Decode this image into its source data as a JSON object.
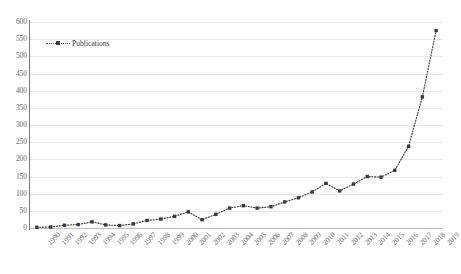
{
  "chart_data": {
    "type": "line",
    "title": "",
    "xlabel": "",
    "ylabel": "",
    "ylim": [
      0,
      600
    ],
    "ytick_step": 50,
    "yticks": [
      600,
      550,
      500,
      450,
      400,
      350,
      300,
      250,
      200,
      150,
      100,
      50,
      0
    ],
    "grid": true,
    "legend_position": "top-left",
    "legend_entries": [
      "Publications"
    ],
    "line_style": "dotted",
    "marker": "square",
    "series_color": "#3a3a3a",
    "categories": [
      "1990",
      "1991",
      "1992",
      "1993",
      "1994",
      "1995",
      "1996",
      "1997",
      "1998",
      "1999",
      "2000",
      "2001",
      "2002",
      "2003",
      "2004",
      "2005",
      "2006",
      "2007",
      "2008",
      "2009",
      "2010",
      "2011",
      "2012",
      "2013",
      "2014",
      "2015",
      "2016",
      "2017",
      "2018",
      "2019"
    ],
    "series": [
      {
        "name": "Publications",
        "values": [
          2,
          3,
          8,
          10,
          18,
          9,
          7,
          12,
          22,
          26,
          34,
          47,
          24,
          40,
          58,
          65,
          58,
          62,
          76,
          88,
          105,
          130,
          108,
          128,
          150,
          148,
          168,
          238,
          382,
          575
        ]
      }
    ]
  },
  "legend": {
    "label": "Publications"
  },
  "axes": {
    "y_labels": [
      "600",
      "550",
      "500",
      "450",
      "400",
      "350",
      "300",
      "250",
      "200",
      "150",
      "100",
      "50",
      "0"
    ],
    "x_labels": [
      "1990",
      "1991",
      "1992",
      "1993",
      "1994",
      "1995",
      "1996",
      "1997",
      "1998",
      "1999",
      "2000",
      "2001",
      "2002",
      "2003",
      "2004",
      "2005",
      "2006",
      "2007",
      "2008",
      "2009",
      "2010",
      "2011",
      "2012",
      "2013",
      "2014",
      "2015",
      "2016",
      "2017",
      "2018",
      "2019"
    ]
  },
  "colors": {
    "series": "#3a3a3a",
    "gridline": "#e9e9e9",
    "axis": "#7a7a7a",
    "text": "#6a6a6a",
    "background": "#ffffff"
  }
}
